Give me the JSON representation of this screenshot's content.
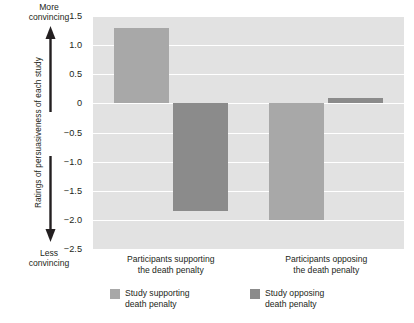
{
  "chart_data": {
    "type": "bar",
    "title": "",
    "xlabel": "",
    "ylabel": "Ratings of persuasiveness of each study",
    "ylim": [
      -2.5,
      1.5
    ],
    "yticks": [
      "1.5",
      "1.0",
      "0.5",
      "0",
      "−0.5",
      "−1.0",
      "−1.5",
      "−2.0",
      "−2.5"
    ],
    "ytick_values": [
      1.5,
      1.0,
      0.5,
      0,
      -0.5,
      -1.0,
      -1.5,
      -2.0,
      -2.5
    ],
    "grid": true,
    "legend_position": "bottom",
    "categories": [
      "Participants supporting\nthe death penalty",
      "Participants opposing\nthe death penalty"
    ],
    "series": [
      {
        "name": "Study supporting\ndeath penalty",
        "color": "#a8a8a8",
        "values": [
          1.3,
          -2.0
        ]
      },
      {
        "name": "Study opposing\ndeath penalty",
        "color": "#8b8b8b",
        "values": [
          -1.85,
          0.1
        ]
      }
    ],
    "annotations": {
      "top": "More\nconvincing",
      "bottom": "Less\nconvincing"
    }
  },
  "axis": {
    "y_title": "Ratings of persuasiveness of each study",
    "more_convincing": "More\nconvincing",
    "less_convincing": "Less\nconvincing"
  },
  "colors": {
    "plot_background": "#e2e2e2",
    "gridline": "#ffffff",
    "series_light": "#a8a8a8",
    "series_dark": "#8b8b8b",
    "text": "#231f20"
  }
}
